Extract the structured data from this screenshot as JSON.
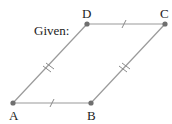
{
  "title": "Given:",
  "figure": {
    "shape": "parallelogram",
    "vertices": [
      {
        "name": "A",
        "x": 13,
        "y": 103,
        "label_x": 13,
        "label_y": 119
      },
      {
        "name": "B",
        "x": 91,
        "y": 103,
        "label_x": 91,
        "label_y": 119
      },
      {
        "name": "C",
        "x": 165,
        "y": 24,
        "label_x": 163,
        "label_y": 18
      },
      {
        "name": "D",
        "x": 87,
        "y": 24,
        "label_x": 85,
        "label_y": 18
      }
    ],
    "congruence_marks": {
      "AB": 1,
      "DC": 1,
      "AD": 2,
      "BC": 2
    },
    "colors": {
      "edge": "#9a9a9a",
      "point": "#6f6f6f",
      "text": "#222222"
    }
  }
}
